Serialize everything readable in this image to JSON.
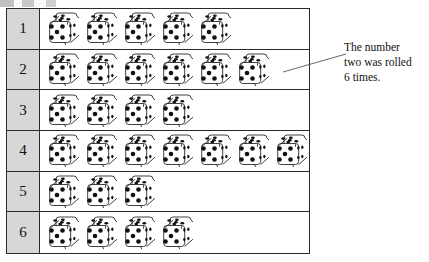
{
  "figure": {
    "type": "pictograph-tally-table"
  },
  "table": {
    "row_label_header": "",
    "rows": [
      {
        "label": "1",
        "count": 5,
        "icon": "die-icon"
      },
      {
        "label": "2",
        "count": 6,
        "icon": "die-icon"
      },
      {
        "label": "3",
        "count": 4,
        "icon": "die-icon"
      },
      {
        "label": "4",
        "count": 7,
        "icon": "die-icon"
      },
      {
        "label": "5",
        "count": 3,
        "icon": "die-icon"
      },
      {
        "label": "6",
        "count": 4,
        "icon": "die-icon"
      }
    ]
  },
  "annotation": {
    "leader_line": "callout-leader-line",
    "lines": [
      "The number",
      "two was rolled",
      "6 times."
    ]
  },
  "chart_data": {
    "type": "bar",
    "orientation": "horizontal",
    "title": "",
    "xlabel": "",
    "ylabel": "",
    "categories": [
      "1",
      "2",
      "3",
      "4",
      "5",
      "6"
    ],
    "values": [
      5,
      6,
      4,
      7,
      3,
      4
    ],
    "unit_symbol": "die",
    "unit_value": 1,
    "total": 29,
    "grid": false,
    "legend": "none",
    "annotations": [
      {
        "category": "2",
        "text": "The number two was rolled 6 times."
      }
    ]
  },
  "colors": {
    "label_cell_bg": "#d7d7d7",
    "border": "#2a2a2a",
    "die_face": "#ffffff",
    "die_pip": "#111111",
    "text": "#111111",
    "background": "#ffffff"
  }
}
